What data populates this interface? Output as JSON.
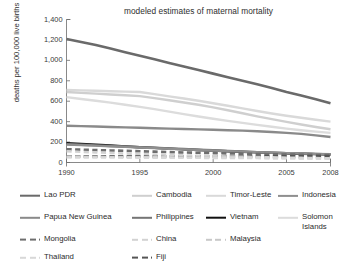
{
  "chart_data": {
    "type": "line",
    "title": "modeled estimates of maternal mortality",
    "xlabel": "",
    "ylabel": "deaths per 100,000 live births",
    "xlim": [
      1990,
      2008
    ],
    "ylim": [
      0,
      1400
    ],
    "ytick_labels": [
      "1,400",
      "1,200",
      "1,000",
      "800",
      "600",
      "400",
      "200",
      "0"
    ],
    "ytick_values": [
      1400,
      1200,
      1000,
      800,
      600,
      400,
      200,
      0
    ],
    "xtick_labels": [
      "1990",
      "1995",
      "2000",
      "2005",
      "2008"
    ],
    "xtick_values": [
      1990,
      1995,
      2000,
      2005,
      2008
    ],
    "grid": false,
    "legend_position": "below",
    "x": [
      1990,
      1991,
      1992,
      1993,
      1994,
      1995,
      1996,
      1997,
      1998,
      1999,
      2000,
      2001,
      2002,
      2003,
      2004,
      2005,
      2006,
      2007,
      2008
    ],
    "series": [
      {
        "name": "Lao PDR",
        "color": "#6a6a6a",
        "style": "solid",
        "width": 2.6,
        "values": [
          1210,
          1180,
          1150,
          1115,
          1080,
          1045,
          1010,
          975,
          940,
          905,
          870,
          835,
          800,
          765,
          730,
          690,
          655,
          620,
          580
        ]
      },
      {
        "name": "Timor-Leste",
        "color": "#d9d9d9",
        "style": "solid",
        "width": 2.4,
        "values": [
          710,
          706,
          702,
          698,
          694,
          690,
          670,
          648,
          626,
          604,
          580,
          556,
          530,
          504,
          480,
          458,
          438,
          418,
          400
        ]
      },
      {
        "name": "Cambodia",
        "color": "#cfcfcf",
        "style": "solid",
        "width": 2.4,
        "values": [
          690,
          682,
          674,
          666,
          658,
          650,
          630,
          610,
          588,
          565,
          540,
          512,
          482,
          452,
          424,
          398,
          372,
          348,
          325
        ]
      },
      {
        "name": "Solomon Islands",
        "color": "#dcdcdc",
        "style": "solid",
        "width": 2.4,
        "values": [
          640,
          622,
          604,
          586,
          566,
          545,
          522,
          498,
          474,
          450,
          428,
          408,
          388,
          368,
          350,
          332,
          316,
          302,
          290
        ]
      },
      {
        "name": "Papua New Guinea",
        "color": "#8a8a8a",
        "style": "solid",
        "width": 2.4,
        "values": [
          360,
          356,
          352,
          348,
          344,
          340,
          336,
          332,
          328,
          324,
          320,
          316,
          312,
          306,
          298,
          290,
          280,
          266,
          250
        ]
      },
      {
        "name": "Vietnam",
        "color": "#111111",
        "style": "solid",
        "width": 2.4,
        "values": [
          190,
          182,
          174,
          166,
          158,
          150,
          143,
          136,
          129,
          122,
          116,
          110,
          104,
          99,
          94,
          90,
          86,
          82,
          78
        ]
      },
      {
        "name": "Philippines",
        "color": "#757575",
        "style": "solid",
        "width": 2.4,
        "values": [
          180,
          174,
          168,
          162,
          156,
          150,
          144,
          138,
          132,
          126,
          120,
          114,
          108,
          102,
          96,
          92,
          88,
          84,
          80
        ]
      },
      {
        "name": "Indonesia",
        "color": "#8f8f8f",
        "style": "solid",
        "width": 2.2,
        "values": [
          175,
          170,
          164,
          158,
          152,
          146,
          140,
          134,
          128,
          122,
          117,
          112,
          107,
          102,
          97,
          93,
          89,
          85,
          82
        ]
      },
      {
        "name": "Mongolia",
        "color": "#6e6e6e",
        "style": "dashed",
        "width": 2.6,
        "values": [
          130,
          126,
          122,
          118,
          114,
          110,
          106,
          102,
          98,
          95,
          92,
          89,
          86,
          83,
          80,
          78,
          76,
          74,
          72
        ]
      },
      {
        "name": "Fiji",
        "color": "#555555",
        "style": "dashed",
        "width": 2.6,
        "values": [
          60,
          60,
          60,
          60,
          60,
          60,
          60,
          60,
          60,
          60,
          60,
          60,
          60,
          60,
          60,
          60,
          60,
          60,
          60
        ]
      },
      {
        "name": "China",
        "color": "#d2d2d2",
        "style": "dashed",
        "width": 2.4,
        "values": [
          110,
          104,
          98,
          93,
          88,
          83,
          79,
          75,
          71,
          67,
          63,
          60,
          57,
          54,
          51,
          48,
          46,
          44,
          42
        ]
      },
      {
        "name": "Malaysia",
        "color": "#c8c8c8",
        "style": "dashed",
        "width": 2.4,
        "values": [
          60,
          58,
          56,
          55,
          54,
          53,
          52,
          51,
          50,
          49,
          48,
          47,
          46,
          45,
          44,
          43,
          42,
          41,
          40
        ]
      },
      {
        "name": "Thailand",
        "color": "#d8d8d8",
        "style": "dashed",
        "width": 2.4,
        "values": [
          50,
          49,
          48,
          48,
          47,
          47,
          46,
          46,
          45,
          45,
          44,
          44,
          43,
          43,
          42,
          42,
          41,
          40,
          40
        ]
      }
    ]
  },
  "legend": {
    "entries": [
      {
        "label": "Lao PDR",
        "color": "#6a6a6a",
        "style": "solid",
        "width": 2.6,
        "col": 0,
        "row": 0
      },
      {
        "label": "Cambodia",
        "color": "#cfcfcf",
        "style": "solid",
        "width": 2.4,
        "col": 1,
        "row": 0
      },
      {
        "label": "Timor-Leste",
        "color": "#d9d9d9",
        "style": "solid",
        "width": 2.4,
        "col": 2,
        "row": 0
      },
      {
        "label": "Indonesia",
        "color": "#8f8f8f",
        "style": "solid",
        "width": 2.2,
        "col": 3,
        "row": 0
      },
      {
        "label": "Papua New Guinea",
        "color": "#8a8a8a",
        "style": "solid",
        "width": 2.4,
        "col": 0,
        "row": 1
      },
      {
        "label": "Philippines",
        "color": "#757575",
        "style": "solid",
        "width": 2.4,
        "col": 1,
        "row": 1
      },
      {
        "label": "Vietnam",
        "color": "#111111",
        "style": "solid",
        "width": 2.6,
        "col": 2,
        "row": 1
      },
      {
        "label": "Solomon\nIslands",
        "color": "#dcdcdc",
        "style": "solid",
        "width": 2.4,
        "col": 3,
        "row": 1
      },
      {
        "label": "Mongolia",
        "color": "#6e6e6e",
        "style": "dashed",
        "width": 2.8,
        "col": 0,
        "row": 2
      },
      {
        "label": "China",
        "color": "#d2d2d2",
        "style": "dashed",
        "width": 2.4,
        "col": 1,
        "row": 2
      },
      {
        "label": "Malaysia",
        "color": "#c8c8c8",
        "style": "dashed",
        "width": 2.4,
        "col": 2,
        "row": 2
      },
      {
        "label": "Thailand",
        "color": "#d8d8d8",
        "style": "dashed",
        "width": 2.4,
        "col": 0,
        "row": 3
      },
      {
        "label": "Fiji",
        "color": "#555555",
        "style": "dashed",
        "width": 2.8,
        "col": 1,
        "row": 3
      }
    ]
  }
}
